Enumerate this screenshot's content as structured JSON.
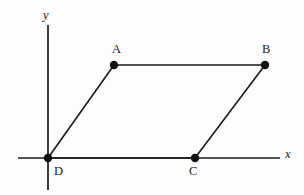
{
  "figure": {
    "background_color": "#fdfdfd",
    "stroke_color": "#1a1a1a",
    "axes": {
      "x_axis": {
        "label": "x",
        "label_style": "italic",
        "y_pixel": 158,
        "x_start_pixel": 18,
        "x_end_pixel": 280
      },
      "y_axis": {
        "label": "y",
        "label_style": "italic",
        "x_pixel": 48,
        "y_start_pixel": 25,
        "y_end_pixel": 190
      },
      "origin_pixel": [
        48,
        158
      ]
    },
    "vertices": [
      {
        "label": "A",
        "x": 114,
        "y": 65,
        "label_pos": "above-left"
      },
      {
        "label": "B",
        "x": 265,
        "y": 65,
        "label_pos": "above-left"
      },
      {
        "label": "C",
        "x": 195,
        "y": 158,
        "label_pos": "below"
      },
      {
        "label": "D",
        "x": 48,
        "y": 158,
        "label_pos": "below-right"
      }
    ],
    "edges": [
      {
        "name": "AB",
        "from": "A",
        "to": "B"
      },
      {
        "name": "BC",
        "from": "B",
        "to": "C"
      },
      {
        "name": "CD",
        "from": "C",
        "to": "D"
      },
      {
        "name": "DA",
        "from": "D",
        "to": "A"
      }
    ],
    "dot_radius": 4.2,
    "line_width": 1.6,
    "axis_line_width": 1.7
  }
}
